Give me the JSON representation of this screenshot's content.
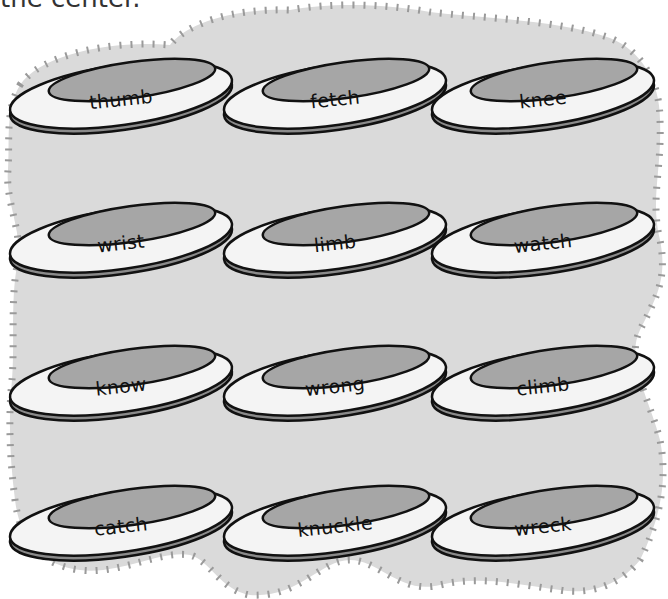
{
  "instruction": {
    "text": "the center."
  },
  "colors": {
    "background": "#ffffff",
    "cloud_fill": "#dadada",
    "cloud_ticks": "#9a9a9a",
    "disc_rim": "#f4f4f4",
    "disc_center": "#a6a6a6",
    "disc_edge": "#8a8a8a",
    "outline": "#111111"
  },
  "discs": [
    {
      "word": "thumb",
      "row": 1,
      "col": 1
    },
    {
      "word": "fetch",
      "row": 1,
      "col": 2
    },
    {
      "word": "knee",
      "row": 1,
      "col": 3
    },
    {
      "word": "wrist",
      "row": 2,
      "col": 1
    },
    {
      "word": "limb",
      "row": 2,
      "col": 2
    },
    {
      "word": "watch",
      "row": 2,
      "col": 3
    },
    {
      "word": "know",
      "row": 3,
      "col": 1
    },
    {
      "word": "wrong",
      "row": 3,
      "col": 2
    },
    {
      "word": "climb",
      "row": 3,
      "col": 3
    },
    {
      "word": "catch",
      "row": 4,
      "col": 1
    },
    {
      "word": "knuckle",
      "row": 4,
      "col": 2
    },
    {
      "word": "wreck",
      "row": 4,
      "col": 3
    }
  ]
}
